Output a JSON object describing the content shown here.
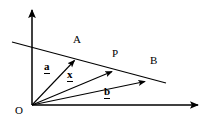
{
  "figure": {
    "kind": "vector-diagram",
    "background_color": "#ffffff",
    "stroke_color": "#000000",
    "axes": {
      "x_axis": {
        "name": "x-axis",
        "from": [
          32,
          105
        ],
        "to": [
          202,
          105
        ],
        "arrow": "right"
      },
      "y_axis": {
        "name": "y-axis",
        "from": [
          32,
          105
        ],
        "to": [
          32,
          6
        ],
        "arrow": "up"
      },
      "origin_point": [
        32,
        105
      ]
    },
    "points": {
      "O": {
        "label": "O",
        "at": [
          32,
          105
        ],
        "label_pos": [
          17,
          107
        ]
      },
      "A": {
        "label": "A",
        "at": [
          76,
          59
        ],
        "label_pos": [
          76,
          40
        ]
      },
      "P": {
        "label": "P",
        "at": [
          114,
          71
        ],
        "label_pos": [
          114,
          53
        ]
      },
      "B": {
        "label": "B",
        "at": [
          147,
          81
        ],
        "label_pos": [
          150,
          58
        ]
      }
    },
    "vectors": {
      "a": {
        "label": "a",
        "underlined": true,
        "from": [
          32,
          105
        ],
        "to": [
          76,
          59
        ],
        "label_pos": [
          44,
          62
        ]
      },
      "x": {
        "label": "x",
        "underlined": true,
        "from": [
          32,
          105
        ],
        "to": [
          114,
          71
        ],
        "label_pos": [
          67,
          70
        ]
      },
      "b": {
        "label": "b",
        "underlined": true,
        "from": [
          32,
          105
        ],
        "to": [
          147,
          81
        ],
        "label_pos": [
          104,
          87
        ]
      }
    },
    "line_through_AB": {
      "name": "line-AB",
      "from": [
        12,
        42
      ],
      "to": [
        166,
        83
      ],
      "passes_through": [
        "A",
        "P",
        "B"
      ]
    }
  }
}
